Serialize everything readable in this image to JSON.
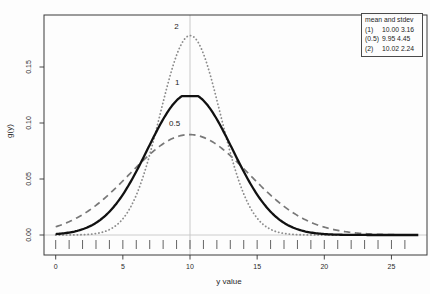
{
  "chart_data": {
    "type": "line",
    "title": "",
    "xlabel": "y value",
    "ylabel": "g(y)",
    "xlim": [
      0,
      27
    ],
    "ylim": [
      0,
      0.196
    ],
    "x_ticks": [
      0,
      5,
      10,
      15,
      20,
      25
    ],
    "x_minor_tick_range": [
      0,
      26
    ],
    "x_minor_tick_step": 1,
    "y_ticks": [
      {
        "v": 0.0,
        "label": "0.00"
      },
      {
        "v": 0.05,
        "label": "0.05"
      },
      {
        "v": 0.1,
        "label": "0.10"
      },
      {
        "v": 0.15,
        "label": "0.15"
      }
    ],
    "grid": "off",
    "legend_position": "top-right",
    "reference_lines": [
      {
        "orientation": "vertical",
        "x": 10,
        "color": "#c3c3c3"
      },
      {
        "orientation": "horizontal",
        "y": 0,
        "color": "#c6c6c6"
      }
    ],
    "series": [
      {
        "name": "0.5",
        "curve": "normal",
        "mean": 9.95,
        "stdev": 4.45,
        "peak_density": 0.0897,
        "line_style": "dashed",
        "color": "#787878",
        "width": 1.7,
        "label": {
          "text": "0.5",
          "x": 8.85,
          "y": 0.0975
        }
      },
      {
        "name": "2",
        "curve": "normal",
        "mean": 10.02,
        "stdev": 2.24,
        "peak_density": 0.1781,
        "line_style": "dotted",
        "color": "#8c8c8c",
        "width": 1.8,
        "label": {
          "text": "2",
          "x": 9.0,
          "y": 0.1835
        }
      },
      {
        "name": "1",
        "curve": "normal",
        "mean": 10.0,
        "stdev": 3.16,
        "peak_density": 0.1262,
        "flat_top_cap": 0.124,
        "line_style": "solid",
        "color": "#111111",
        "width": 2.3,
        "label": {
          "text": "1",
          "x": 9.05,
          "y": 0.1335
        }
      }
    ],
    "legend": {
      "title": "mean and stdev",
      "entries": [
        {
          "key": "(1)",
          "value": "10.00 3.16"
        },
        {
          "key": "(0.5)",
          "value": "9.95 4.45"
        },
        {
          "key": "(2)",
          "value": "10.02 2.24"
        }
      ]
    }
  }
}
